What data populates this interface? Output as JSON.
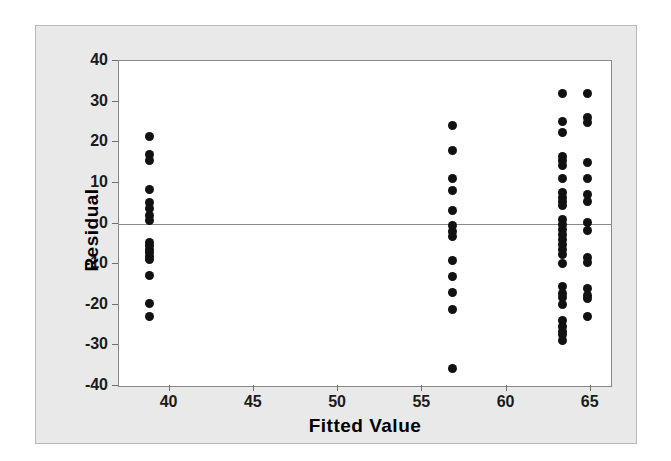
{
  "chart_data": {
    "type": "scatter",
    "title": "",
    "xlabel": "Fitted Value",
    "ylabel": "Residual",
    "xlim": [
      37.0,
      66.2
    ],
    "ylim": [
      -40,
      40
    ],
    "xticks": [
      40,
      45,
      50,
      55,
      60,
      65
    ],
    "yticks": [
      40,
      30,
      20,
      10,
      0,
      -10,
      -20,
      -30,
      -40
    ],
    "xtick_labels": [
      "40",
      "45",
      "50",
      "55",
      "60",
      "65"
    ],
    "ytick_labels": [
      "40",
      "30",
      "20",
      "10",
      "0",
      "-10",
      "-20",
      "-30",
      "-40"
    ],
    "grid": false,
    "legend": null,
    "reference_line": {
      "orientation": "horizontal",
      "y": 0,
      "color": "#8a8a8a"
    },
    "marker": {
      "shape": "circle",
      "color": "#111111",
      "size": 9
    },
    "groups": [
      {
        "name": "group-38.8",
        "x": 38.8,
        "y": [
          21.3,
          17.0,
          15.6,
          8.4,
          5.2,
          3.6,
          2.0,
          0.8,
          -4.6,
          -5.4,
          -6.3,
          -7.2,
          -8.0,
          -8.8,
          -12.8,
          -19.8,
          -23.0
        ]
      },
      {
        "name": "group-56.8",
        "x": 56.8,
        "y": [
          24.2,
          18.0,
          11.1,
          8.1,
          3.2,
          -0.6,
          -1.9,
          -3.3,
          -9.1,
          -13.0,
          -17.0,
          -21.1,
          -35.8
        ]
      },
      {
        "name": "group-63.3",
        "x": 63.3,
        "y": [
          32.0,
          25.2,
          22.3,
          16.5,
          15.4,
          14.3,
          11.2,
          7.6,
          6.4,
          5.5,
          4.4,
          0.9,
          -0.3,
          -1.4,
          -2.6,
          -3.9,
          -5.2,
          -6.4,
          -7.6,
          -9.8,
          -15.6,
          -17.2,
          -18.3,
          -20.0,
          -23.8,
          -25.3,
          -26.6,
          -27.3,
          -28.8
        ]
      },
      {
        "name": "group-64.8",
        "x": 64.8,
        "y": [
          32.0,
          26.2,
          24.9,
          15.0,
          11.0,
          7.2,
          5.4,
          0.3,
          -1.6,
          -8.3,
          -9.5,
          -16.0,
          -17.6,
          -18.5,
          -23.0
        ]
      }
    ]
  },
  "axes": {
    "x_title": "Fitted Value",
    "y_title": "Residual"
  },
  "colors": {
    "figure_background": "#e9e9e9",
    "plot_background": "#ffffff",
    "marker": "#111111",
    "axis_line": "#8a8a8a",
    "text": "#000000"
  }
}
